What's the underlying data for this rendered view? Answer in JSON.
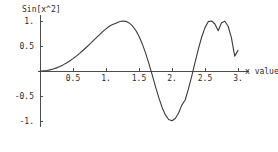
{
  "chart_data": {
    "type": "line",
    "title": "",
    "ylabel": "Sin[x^2]",
    "xlabel": "x value",
    "grid": false,
    "legend": "none",
    "xlim": [
      0,
      3.1
    ],
    "ylim": [
      -1.12,
      1.12
    ],
    "x_ticks": [
      {
        "value": 0.5,
        "label": "0.5"
      },
      {
        "value": 1.0,
        "label": "1."
      },
      {
        "value": 1.5,
        "label": "1.5"
      },
      {
        "value": 2.0,
        "label": "2."
      },
      {
        "value": 2.5,
        "label": "2.5"
      },
      {
        "value": 3.0,
        "label": "3."
      }
    ],
    "y_ticks": [
      {
        "value": 1.0,
        "label": "1."
      },
      {
        "value": 0.5,
        "label": "0.5"
      },
      {
        "value": -0.5,
        "label": "-0.5"
      },
      {
        "value": -1.0,
        "label": "-1."
      }
    ],
    "series": [
      {
        "name": "Sin[x^2]",
        "color": "#3a3a3a",
        "x": [
          0,
          0.05,
          0.1,
          0.15,
          0.2,
          0.25,
          0.3,
          0.35,
          0.4,
          0.45,
          0.5,
          0.55,
          0.6,
          0.65,
          0.7,
          0.75,
          0.8,
          0.85,
          0.9,
          0.95,
          1.0,
          1.05,
          1.1,
          1.15,
          1.2,
          1.25,
          1.3,
          1.35,
          1.4,
          1.45,
          1.5,
          1.55,
          1.6,
          1.65,
          1.7,
          1.75,
          1.8,
          1.85,
          1.9,
          1.95,
          2.0,
          2.05,
          2.1,
          2.15,
          2.2,
          2.25,
          2.3,
          2.35,
          2.4,
          2.45,
          2.5,
          2.55,
          2.6,
          2.65,
          2.7,
          2.75,
          2.8,
          2.85,
          2.9,
          2.95,
          3.0
        ],
        "y": [
          0.0,
          0.0025,
          0.01,
          0.0225,
          0.04,
          0.0625,
          0.0899,
          0.1222,
          0.1593,
          0.2011,
          0.2474,
          0.298,
          0.3523,
          0.4101,
          0.4706,
          0.5331,
          0.5969,
          0.6609,
          0.7243,
          0.7859,
          0.8415,
          0.8949,
          0.929,
          0.9564,
          0.9854,
          0.999,
          0.9928,
          0.9623,
          0.9041,
          0.8153,
          0.6945,
          0.5415,
          0.3582,
          0.149,
          -0.0779,
          -0.3105,
          -0.5332,
          -0.7282,
          -0.8787,
          -0.971,
          -0.9962,
          -0.9515,
          -0.8415,
          -0.6781,
          -0.5799,
          -0.3545,
          -0.0954,
          0.1771,
          0.4425,
          0.6796,
          0.8676,
          0.9882,
          0.9996,
          0.9396,
          0.8046,
          0.965,
          0.9945,
          0.8954,
          0.6674,
          0.2975,
          0.4121
        ]
      }
    ],
    "annotations": []
  },
  "layout": {
    "origin_x_px": 40,
    "origin_y_px": 71,
    "px_per_x_unit": 66,
    "px_per_y_unit": 50,
    "axis_color": "#4d4d4d"
  },
  "labels": {
    "y_axis_title": "Sin[x^2]",
    "x_axis_title": "x value"
  }
}
